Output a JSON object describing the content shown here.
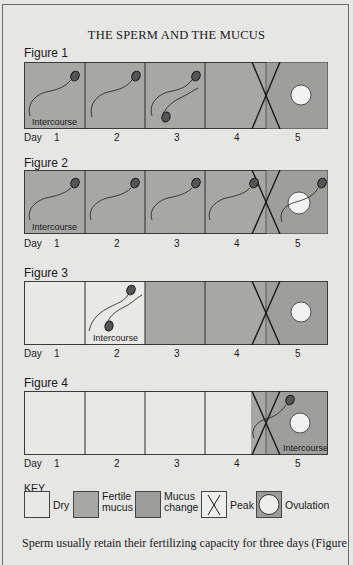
{
  "title": "THE SPERM AND THE MUCUS",
  "day_label": "Day",
  "days": [
    "1",
    "2",
    "3",
    "4",
    "5"
  ],
  "colors": {
    "page": "#e6e6e4",
    "dry": "#e8e8e6",
    "fertile_mucus": "#a7a7a5",
    "mucus_change": "#9c9c9a",
    "ovum": "#f2f2f2",
    "line": "#2a2a2a"
  },
  "figures": [
    {
      "label": "Figure 1",
      "intercourse_label": "Intercourse",
      "intercourse_day": "1",
      "cells": [
        "fertile",
        "fertile",
        "fertile",
        "fertile",
        "change"
      ],
      "sperm_days": [
        "1",
        "2",
        "3"
      ],
      "peak_day": "4-5",
      "ovulation_day": "5"
    },
    {
      "label": "Figure 2",
      "intercourse_label": "Intercourse",
      "intercourse_day": "1",
      "cells": [
        "fertile",
        "fertile",
        "fertile",
        "fertile",
        "change"
      ],
      "sperm_days": [
        "1",
        "2",
        "3",
        "4",
        "5"
      ],
      "peak_day": "4-5",
      "ovulation_day": "5"
    },
    {
      "label": "Figure 3",
      "intercourse_label": "Intercourse",
      "intercourse_day": "2",
      "cells": [
        "dry",
        "dry",
        "fertile",
        "fertile",
        "change"
      ],
      "sperm_days": [
        "2"
      ],
      "peak_day": "4-5",
      "ovulation_day": "5"
    },
    {
      "label": "Figure 4",
      "intercourse_label": "Intercourse",
      "intercourse_day": "5",
      "cells": [
        "dry",
        "dry",
        "dry",
        "dry-fertile",
        "change"
      ],
      "sperm_days": [
        "5"
      ],
      "peak_day": "4-5",
      "ovulation_day": "5"
    }
  ],
  "key": {
    "title": "KEY",
    "items": [
      {
        "label_line1": "Dry",
        "label_line2": ""
      },
      {
        "label_line1": "Fertile",
        "label_line2": "mucus"
      },
      {
        "label_line1": "Mucus",
        "label_line2": "change"
      },
      {
        "label_line1": "Peak",
        "label_line2": ""
      },
      {
        "label_line1": "Ovulation",
        "label_line2": ""
      }
    ]
  },
  "body_text": "Sperm usually retain their fertilizing capacity for three days (Figure"
}
